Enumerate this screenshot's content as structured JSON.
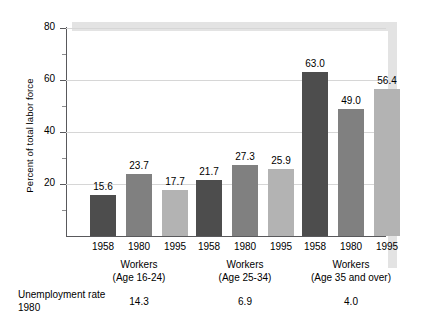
{
  "chart_data": {
    "type": "bar",
    "title": "",
    "xlabel": "",
    "ylabel": "Percent of total labor force",
    "ylim": [
      0,
      80
    ],
    "yticks": [
      0,
      20,
      40,
      60,
      80
    ],
    "ytick_labels": [
      "",
      "20",
      "40",
      "60",
      "80"
    ],
    "grid": true,
    "legend": "none",
    "categories": [
      "1958",
      "1980",
      "1995"
    ],
    "groups": [
      {
        "name": "Workers (Age 16-24)",
        "label_line1": "Workers",
        "label_line2": "(Age 16-24)",
        "values": [
          15.6,
          23.7,
          17.7
        ],
        "value_labels": [
          "15.6",
          "23.7",
          "17.7"
        ],
        "unemployment_rate_1980": "14.3"
      },
      {
        "name": "Workers (Age 25-34)",
        "label_line1": "Workers",
        "label_line2": "(Age 25-34)",
        "values": [
          21.7,
          27.3,
          25.9
        ],
        "value_labels": [
          "21.7",
          "27.3",
          "25.9"
        ],
        "unemployment_rate_1980": "6.9"
      },
      {
        "name": "Workers (Age 35 and over)",
        "label_line1": "Workers",
        "label_line2": "(Age 35 and over)",
        "values": [
          63.0,
          49.0,
          56.4
        ],
        "value_labels": [
          "63.0",
          "49.0",
          "56.4"
        ],
        "unemployment_rate_1980": "4.0"
      }
    ],
    "series": [
      {
        "name": "1958",
        "values": [
          15.6,
          21.7,
          63.0
        ],
        "color": "#4d4d4d"
      },
      {
        "name": "1980",
        "values": [
          23.7,
          27.3,
          49.0
        ],
        "color": "#808080"
      },
      {
        "name": "1995",
        "values": [
          17.7,
          25.9,
          56.4
        ],
        "color": "#b3b3b3"
      }
    ],
    "annotations": {
      "unemployment_label_line1": "Unemployment",
      "unemployment_label_line2": "rate 1980",
      "unemployment_values": [
        "14.3",
        "6.9",
        "4.0"
      ]
    },
    "colors": {
      "series_1958": "#4d4d4d",
      "series_1980": "#808080",
      "series_1995": "#b3b3b3",
      "axis": "#59595c",
      "grid": "#d6d6d6",
      "shadow": "#e3e3e3",
      "background": "#ffffff"
    }
  }
}
